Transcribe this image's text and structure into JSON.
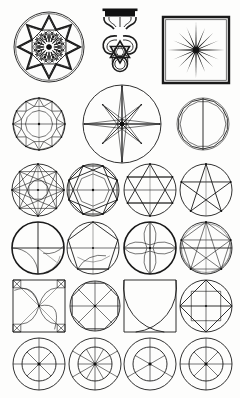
{
  "plate": {
    "title": "Geometric Construction Plate",
    "background_color": "#fdfdfc",
    "ink_color": "#1a1a1a",
    "width": 240,
    "height": 398,
    "row_count": 6,
    "figure_count": 23
  },
  "rows": [
    {
      "index": 1,
      "name": "ornament-row",
      "label": "Ornamental motifs",
      "figures": [
        {
          "id": "fig-1-1",
          "name": "arabesque-medallion",
          "label": "Circular arabesque medallion with eight-lobed rosette",
          "shape": "medallion",
          "cx": 49,
          "cy": 47,
          "r": 35,
          "lobes": 8
        },
        {
          "id": "fig-1-2",
          "name": "interlace-pendant",
          "label": "Vertical pendant finial with interlaced hexagram",
          "shape": "pendant",
          "cx": 120,
          "cy": 46,
          "w": 40,
          "h": 78
        },
        {
          "id": "fig-1-3",
          "name": "sunburst-square",
          "label": "Square frame enclosing sixteen-ray sunburst",
          "shape": "sunburst",
          "cx": 196,
          "cy": 50,
          "half": 33,
          "rays": 16
        }
      ]
    },
    {
      "index": 2,
      "name": "compass-row",
      "label": "Compass rose and facet circles",
      "figures": [
        {
          "id": "fig-2-1",
          "name": "facet-circle",
          "label": "Circle with inscribed twelve-point facet star",
          "shape": "facet",
          "cx": 39,
          "cy": 124,
          "r": 26,
          "points": 12
        },
        {
          "id": "fig-2-2",
          "name": "compass-rose",
          "label": "Eight-point compass rose in circle",
          "shape": "compass",
          "cx": 122,
          "cy": 124,
          "r": 39,
          "points": 8
        },
        {
          "id": "fig-2-3",
          "name": "polygon-circle",
          "label": "Circle with inscribed many-sided polygon and vertical diameter",
          "shape": "polycircle",
          "cx": 203,
          "cy": 124,
          "r": 26,
          "sides": 14
        }
      ]
    },
    {
      "index": 3,
      "name": "star-polygon-row",
      "label": "Star polygons in circles",
      "figures": [
        {
          "id": "fig-3-1",
          "name": "octagram-star",
          "label": "Eight-pointed star polygon in circle",
          "shape": "star",
          "cx": 38,
          "cy": 190,
          "r": 26,
          "points": 8,
          "step": 3
        },
        {
          "id": "fig-3-2",
          "name": "octagon-square-star",
          "label": "Octagon with two inscribed squares in circle",
          "shape": "octagon",
          "cx": 93,
          "cy": 190,
          "r": 26,
          "points": 8
        },
        {
          "id": "fig-3-3",
          "name": "hexagram-star",
          "label": "Hexagram in circle with chords",
          "shape": "hexagram",
          "cx": 150,
          "cy": 190,
          "r": 26,
          "points": 6
        },
        {
          "id": "fig-3-4",
          "name": "pentagram-star",
          "label": "Inverted pentagram in circle",
          "shape": "pentagram",
          "cx": 206,
          "cy": 190,
          "r": 26,
          "points": 5
        }
      ]
    },
    {
      "index": 4,
      "name": "construction-row",
      "label": "Arc and polygon constructions",
      "figures": [
        {
          "id": "fig-4-1",
          "name": "axis-arc-circle",
          "label": "Circle with cross axes and construction arcs",
          "shape": "axisarc",
          "cx": 38,
          "cy": 248,
          "r": 26
        },
        {
          "id": "fig-4-2",
          "name": "pentagon-construction",
          "label": "Pentagon inscribed in circle with chords",
          "shape": "pentagon",
          "cx": 93,
          "cy": 248,
          "r": 26
        },
        {
          "id": "fig-4-3",
          "name": "petal-circle",
          "label": "Circle with four curved petal arcs",
          "shape": "petal",
          "cx": 150,
          "cy": 248,
          "r": 26
        },
        {
          "id": "fig-4-4",
          "name": "pentagram-arc-circle",
          "label": "Pentagon and pentagram with construction arcs",
          "shape": "pentarc",
          "cx": 206,
          "cy": 248,
          "r": 26
        }
      ]
    },
    {
      "index": 5,
      "name": "square-row",
      "label": "Square and circle constructions",
      "figures": [
        {
          "id": "fig-5-1",
          "name": "pinwheel-square",
          "label": "Square with corner squares, diagonals and spiral arcs",
          "shape": "pinwheel",
          "cx": 39,
          "cy": 306,
          "half": 26
        },
        {
          "id": "fig-5-2",
          "name": "spoked-circle",
          "label": "Circle with octagon and eight radial spokes",
          "shape": "spoke",
          "cx": 95,
          "cy": 306,
          "r": 25,
          "spokes": 8
        },
        {
          "id": "fig-5-3",
          "name": "ogee-square",
          "label": "Square with two crossing arcs forming ogee curve",
          "shape": "ogee",
          "cx": 150,
          "cy": 306,
          "half": 26
        },
        {
          "id": "fig-5-4",
          "name": "diamond-circle",
          "label": "Circle with inscribed square rotated as diamond",
          "shape": "diamond",
          "cx": 206,
          "cy": 306,
          "r": 26
        }
      ]
    },
    {
      "index": 6,
      "name": "rosette-row",
      "label": "Concentric spoked rosettes",
      "figures": [
        {
          "id": "fig-6-1",
          "name": "rosette-eight",
          "label": "Double circle rosette with eight spokes",
          "shape": "rosette",
          "cx": 39,
          "cy": 364,
          "r": 26,
          "inner": 17,
          "spokes": 8
        },
        {
          "id": "fig-6-2",
          "name": "rosette-twelve",
          "label": "Double circle rosette with twelve spokes",
          "shape": "rosette",
          "cx": 95,
          "cy": 364,
          "r": 26,
          "inner": 17,
          "spokes": 12
        },
        {
          "id": "fig-6-3",
          "name": "rosette-six",
          "label": "Double circle rosette with six spokes",
          "shape": "rosette",
          "cx": 150,
          "cy": 364,
          "r": 26,
          "inner": 17,
          "spokes": 6
        },
        {
          "id": "fig-6-4",
          "name": "rosette-eight-cross",
          "label": "Double circle rosette with eight spokes and cross axes",
          "shape": "rosette",
          "cx": 206,
          "cy": 364,
          "r": 26,
          "inner": 17,
          "spokes": 8
        }
      ]
    }
  ]
}
